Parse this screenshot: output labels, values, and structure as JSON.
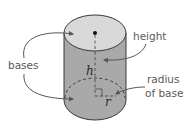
{
  "diagram": {
    "labels": {
      "height": "height",
      "bases": "bases",
      "radius_line1": "radius",
      "radius_line2": "of base",
      "h": "h",
      "r": "r"
    },
    "colors": {
      "top_face": "#d9d9d9",
      "side_face": "#a9a9a9",
      "outline": "#3a3a3a",
      "arrow": "#555555",
      "label_text": "#5a5a5a",
      "background": "#ffffff"
    }
  }
}
